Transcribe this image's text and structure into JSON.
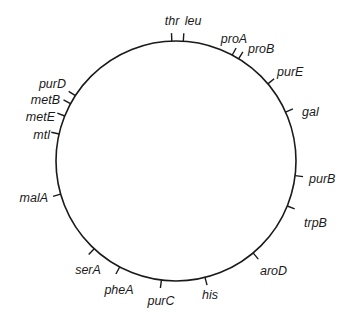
{
  "diagram": {
    "type": "circular-genetic-map",
    "colors": {
      "line": "#1a1a1a",
      "background": "#ffffff",
      "text": "#1a1a1a"
    },
    "circle": {
      "cx": 176,
      "cy": 161,
      "r": 120
    },
    "genes": [
      {
        "name": "thr",
        "angle": 358,
        "lx": 172,
        "ly": 22,
        "anchor": "middle"
      },
      {
        "name": "leu",
        "angle": 3.5,
        "lx": 193,
        "ly": 22,
        "anchor": "middle"
      },
      {
        "name": "proA",
        "angle": 28,
        "lx": 234,
        "ly": 40,
        "anchor": "middle"
      },
      {
        "name": "proB",
        "angle": 31.5,
        "lx": 248,
        "ly": 50,
        "anchor": "start"
      },
      {
        "name": "purE",
        "angle": 50,
        "lx": 277,
        "ly": 73,
        "anchor": "start"
      },
      {
        "name": "gal",
        "angle": 66,
        "lx": 302,
        "ly": 113,
        "anchor": "start"
      },
      {
        "name": "purB",
        "angle": 97,
        "lx": 309,
        "ly": 180,
        "anchor": "start"
      },
      {
        "name": "trpB",
        "angle": 112,
        "lx": 304,
        "ly": 224,
        "anchor": "start"
      },
      {
        "name": "aroD",
        "angle": 140,
        "lx": 260,
        "ly": 272,
        "anchor": "start"
      },
      {
        "name": "his",
        "angle": 166,
        "lx": 210,
        "ly": 296,
        "anchor": "middle"
      },
      {
        "name": "purC",
        "angle": 187,
        "lx": 161,
        "ly": 302,
        "anchor": "middle"
      },
      {
        "name": "pheA",
        "angle": 208,
        "lx": 119,
        "ly": 291,
        "anchor": "middle"
      },
      {
        "name": "serA",
        "angle": 223,
        "lx": 88,
        "ly": 271,
        "anchor": "middle"
      },
      {
        "name": "malA",
        "angle": 254,
        "lx": 48,
        "ly": 199,
        "anchor": "end"
      },
      {
        "name": "mtl",
        "angle": 283,
        "lx": 50,
        "ly": 136,
        "anchor": "end"
      },
      {
        "name": "metE",
        "angle": 292,
        "lx": 55,
        "ly": 118,
        "anchor": "end"
      },
      {
        "name": "metB",
        "angle": 298.5,
        "lx": 60,
        "ly": 101,
        "anchor": "end"
      },
      {
        "name": "purD",
        "angle": 303,
        "lx": 66,
        "ly": 85,
        "anchor": "end"
      }
    ]
  }
}
